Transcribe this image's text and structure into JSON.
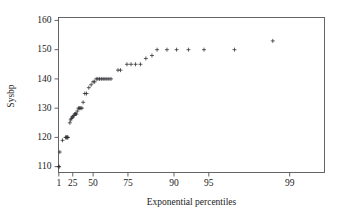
{
  "chart_data": {
    "type": "scatter",
    "title": "",
    "subtitle": "",
    "xlabel": "Exponential percentiles",
    "ylabel": "Sysbp",
    "marker": "plus",
    "marker_color": "#2b2b30",
    "grid": false,
    "legend": null,
    "xscale": "exponential-percentile",
    "xlim": [
      0.4,
      99.5
    ],
    "ylim": [
      108,
      161
    ],
    "xticks": [
      1,
      25,
      50,
      75,
      90,
      95,
      99
    ],
    "xticklabels": [
      "1",
      "25",
      "50",
      "75",
      "90",
      "95",
      "99"
    ],
    "yticks": [
      110,
      120,
      130,
      140,
      150,
      160
    ],
    "yticklabels": [
      "110",
      "120",
      "130",
      "140",
      "150",
      "160"
    ],
    "x": [
      1.0,
      1.6,
      3.0,
      8.0,
      13.5,
      14.6,
      15.6,
      16.6,
      17.5,
      20.5,
      21.8,
      23.0,
      24.2,
      25.4,
      26.6,
      27.8,
      29.0,
      30.2,
      31.5,
      33.0,
      34.5,
      36.0,
      37.5,
      39.0,
      41.0,
      43.0,
      45.5,
      48.0,
      50.0,
      51.5,
      53.0,
      54.5,
      56.0,
      57.5,
      59.0,
      60.5,
      62.0,
      63.5,
      65.0,
      69.5,
      71.0,
      74.5,
      76.5,
      78.5,
      80.5,
      82.5,
      84.5,
      86.0,
      88.5,
      90.5,
      92.5,
      94.5,
      97.0,
      98.6
    ],
    "y": [
      110,
      110,
      115,
      119,
      120,
      120,
      120,
      120,
      120,
      125,
      126,
      126.5,
      127,
      127,
      127.5,
      128,
      128,
      128,
      129,
      130,
      130,
      130,
      130,
      132,
      135,
      135,
      137,
      138,
      139,
      139,
      140,
      140,
      140,
      140,
      140,
      140,
      140,
      140,
      140,
      143,
      143,
      145,
      145,
      145,
      145,
      147,
      148,
      150,
      150,
      150,
      150,
      150,
      150,
      153
    ],
    "n_points": 54
  },
  "axes": {
    "y_axis_title": "Sysbp",
    "x_axis_title": "Exponential percentiles"
  }
}
